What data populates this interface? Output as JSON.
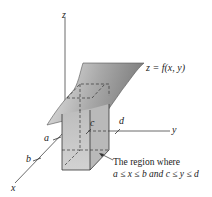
{
  "diagram": {
    "axes": {
      "z_label": "z",
      "y_label": "y",
      "x_label": "x"
    },
    "ticks": {
      "a": "a",
      "b": "b",
      "c": "c",
      "d": "d"
    },
    "surface_label": "z = f(x, y)",
    "region_caption": {
      "line1": "The region where",
      "line2": "a ≤ x ≤ b and c ≤ y ≤ d"
    },
    "colors": {
      "surface_light": "#e6e6e6",
      "surface_dark": "#8a8a8a",
      "box_fill": "#c8c8c8",
      "box_side": "#b4b4b4",
      "axis": "#444444"
    }
  }
}
